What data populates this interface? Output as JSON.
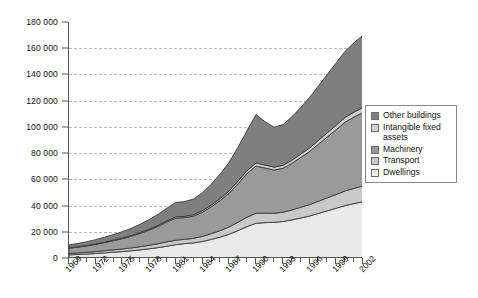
{
  "chart_data": {
    "type": "area",
    "stacked": true,
    "title": "",
    "subtitle": "",
    "xlabel": "",
    "ylabel": "",
    "ylim": [
      0,
      180000
    ],
    "ytick_step": 20000,
    "ytick_labels": [
      "180 000",
      "160 000",
      "140 000",
      "120 000",
      "100 000",
      "80 000",
      "60 000",
      "40 000",
      "20 000",
      "0"
    ],
    "ytick_values": [
      180000,
      160000,
      140000,
      120000,
      100000,
      80000,
      60000,
      40000,
      20000,
      0
    ],
    "grid": true,
    "grid_axis": "y",
    "grid_style": "dashed",
    "legend_position": "right",
    "x": [
      1969,
      1970,
      1971,
      1972,
      1973,
      1974,
      1975,
      1976,
      1977,
      1978,
      1979,
      1980,
      1981,
      1982,
      1983,
      1984,
      1985,
      1986,
      1987,
      1988,
      1989,
      1990,
      1991,
      1992,
      1993,
      1994,
      1995,
      1996,
      1997,
      1998,
      1999,
      2000,
      2001,
      2002
    ],
    "xtick_labels": [
      "1969",
      "1972",
      "1975",
      "1978",
      "1981",
      "1984",
      "1987",
      "1990",
      "1993",
      "1996",
      "1999",
      "2002"
    ],
    "xtick_label_values": [
      1969,
      1972,
      1975,
      1978,
      1981,
      1984,
      1987,
      1990,
      1993,
      1996,
      1999,
      2002
    ],
    "xtick_label_rotation": -45,
    "series": [
      {
        "name": "Dwellings",
        "color": "#e9e9e9",
        "stack_order": 1,
        "values": [
          2400,
          2700,
          3000,
          3400,
          3900,
          4400,
          4900,
          5500,
          6200,
          7000,
          7900,
          9000,
          10200,
          11000,
          11500,
          12600,
          14200,
          16000,
          18200,
          21000,
          24000,
          26500,
          27000,
          27200,
          27800,
          29000,
          30500,
          32000,
          34000,
          36000,
          38000,
          40000,
          41500,
          43000
        ]
      },
      {
        "name": "Transport",
        "color": "#c9c9c9",
        "stack_order": 2,
        "values": [
          1100,
          1200,
          1350,
          1500,
          1700,
          1850,
          2000,
          2200,
          2450,
          2700,
          3000,
          3300,
          3400,
          3300,
          3500,
          3900,
          4400,
          5000,
          5600,
          6400,
          7200,
          7600,
          7200,
          6900,
          7100,
          7600,
          8200,
          8700,
          9300,
          9900,
          10500,
          11200,
          11600,
          12000
        ]
      },
      {
        "name": "Machinery",
        "color": "#9a9a9a",
        "stack_order": 3,
        "values": [
          4000,
          4400,
          4900,
          5500,
          6200,
          7000,
          7900,
          8900,
          10200,
          11600,
          13200,
          15200,
          16800,
          16500,
          17000,
          18500,
          20600,
          23000,
          25800,
          29500,
          33500,
          36000,
          34500,
          33000,
          33500,
          35500,
          38000,
          40500,
          43500,
          46500,
          49500,
          52500,
          54500,
          56000
        ]
      },
      {
        "name": "Intangible fixed assets",
        "color": "#d0d0d0",
        "stack_order": 4,
        "values": [
          260,
          290,
          320,
          360,
          400,
          450,
          500,
          560,
          630,
          710,
          800,
          900,
          1000,
          1000,
          1050,
          1150,
          1300,
          1450,
          1650,
          1900,
          2150,
          2300,
          2250,
          2200,
          2250,
          2400,
          2550,
          2750,
          2950,
          3150,
          3350,
          3550,
          3700,
          3850
        ]
      },
      {
        "name": "Other buildings",
        "color": "#7f7f7f",
        "stack_order": 5,
        "values": [
          2200,
          2500,
          2850,
          3250,
          3700,
          4200,
          4800,
          5500,
          6300,
          7300,
          8400,
          9700,
          11000,
          11200,
          12000,
          13800,
          16000,
          18800,
          22000,
          26000,
          30500,
          37000,
          33000,
          30500,
          31000,
          33000,
          35500,
          38500,
          41500,
          44500,
          47500,
          50500,
          53000,
          55000
        ]
      }
    ],
    "totals": [
      9960,
      11090,
      12420,
      14010,
      15900,
      17900,
      20100,
      22660,
      25780,
      29310,
      33300,
      38100,
      42400,
      43000,
      45050,
      49950,
      56500,
      64250,
      73250,
      84800,
      97350,
      109400,
      103950,
      99800,
      101650,
      107500,
      114750,
      122450,
      131250,
      140050,
      148850,
      157750,
      164300,
      169850
    ],
    "annotations": []
  },
  "legend": {
    "items": [
      {
        "label": "Other buildings",
        "color": "#7f7f7f"
      },
      {
        "label": "Intangible fixed assets",
        "color": "#d0d0d0"
      },
      {
        "label": "Machinery",
        "color": "#9a9a9a"
      },
      {
        "label": "Transport",
        "color": "#c9c9c9"
      },
      {
        "label": "Dwellings",
        "color": "#eeeeee"
      }
    ]
  }
}
